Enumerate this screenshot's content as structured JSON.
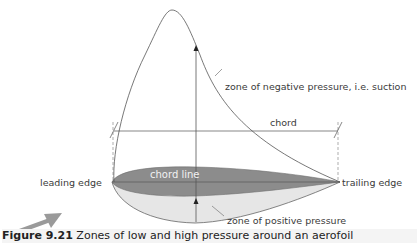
{
  "diagram": {
    "labels": {
      "negative_zone": "zone of negative pressure, i.e. suction",
      "positive_zone": "zone of positive pressure",
      "chord": "chord",
      "chord_line": "chord line",
      "leading_edge": "leading edge",
      "trailing_edge": "trailing edge"
    },
    "colors": {
      "aerofoil_fill": "#8c8c8c",
      "positive_zone_fill": "#e6e6e6",
      "line": "#555555",
      "airflow_arrow": "#9a9a9a"
    }
  },
  "caption": {
    "figure_number": "Figure 9.21",
    "text": "Zones of low and high pressure around an aerofoil"
  }
}
